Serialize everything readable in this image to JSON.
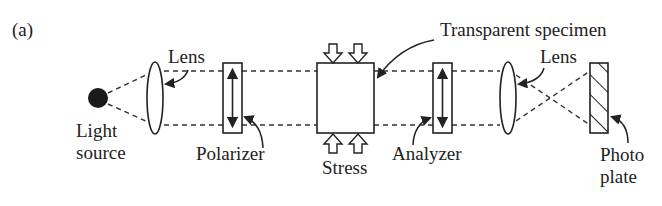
{
  "figure": {
    "panel_label": "(a)"
  },
  "components": {
    "light_source": {
      "label_line1": "Light",
      "label_line2": "source"
    },
    "lens_1": {
      "label": "Lens"
    },
    "polarizer": {
      "label": "Polarizer"
    },
    "specimen": {
      "label": "Transparent specimen"
    },
    "stress": {
      "label": "Stress"
    },
    "analyzer": {
      "label": "Analyzer"
    },
    "lens_2": {
      "label": "Lens"
    },
    "photo_plate": {
      "label_line1": "Photo",
      "label_line2": "plate"
    }
  },
  "colors": {
    "ink": "#222222",
    "background": "#ffffff"
  }
}
